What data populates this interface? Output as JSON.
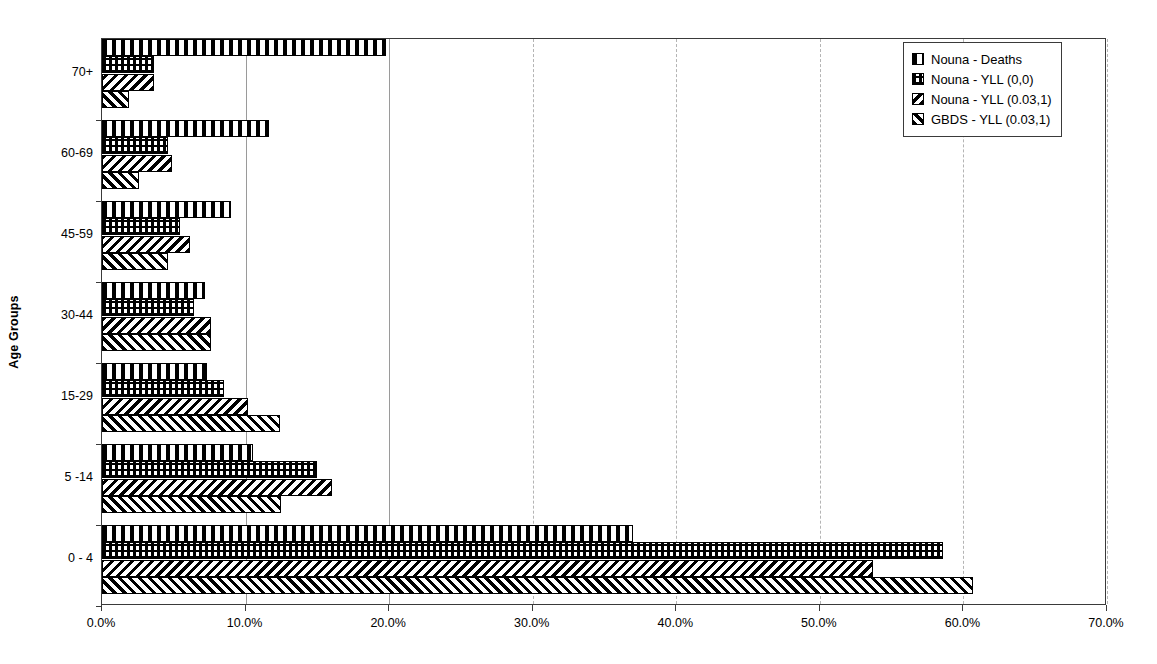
{
  "chart_data": {
    "type": "bar",
    "orientation": "horizontal",
    "title": "",
    "xlabel": "",
    "ylabel": "Age Groups",
    "categories": [
      "0 - 4",
      "5 -14",
      "15-29",
      "30-44",
      "45-59",
      "60-69",
      "70+"
    ],
    "category_order_top_to_bottom": [
      "70+",
      "60-69",
      "45-59",
      "30-44",
      "15-29",
      "5 -14",
      "0 - 4"
    ],
    "xlim": [
      0,
      70
    ],
    "xticks": [
      0,
      10,
      20,
      30,
      40,
      50,
      60,
      70
    ],
    "xticklabels": [
      "0.0%",
      "10.0%",
      "20.0%",
      "30.0%",
      "40.0%",
      "50.0%",
      "60.0%",
      "70.0%"
    ],
    "grid": "vertical",
    "legend_position": "top-right",
    "series": [
      {
        "name": "Nouna - Deaths",
        "pattern": "vertical-stripes",
        "values": [
          37.0,
          10.5,
          7.3,
          7.2,
          9.0,
          11.6,
          19.8
        ]
      },
      {
        "name": "Nouna - YLL (0,0)",
        "pattern": "cross-hatch-grid",
        "values": [
          58.6,
          15.0,
          8.5,
          6.4,
          5.4,
          4.6,
          3.6
        ]
      },
      {
        "name": "Nouna - YLL (0.03,1)",
        "pattern": "backward-diagonal",
        "values": [
          53.7,
          16.0,
          10.2,
          7.6,
          6.1,
          4.9,
          3.6
        ]
      },
      {
        "name": "GBDS - YLL (0.03,1)",
        "pattern": "forward-diagonal",
        "values": [
          60.7,
          12.5,
          12.4,
          7.6,
          4.6,
          2.6,
          1.9
        ]
      }
    ]
  },
  "legend": {
    "items": [
      {
        "label": "Nouna - Deaths"
      },
      {
        "label": "Nouna - YLL (0,0)"
      },
      {
        "label": "Nouna - YLL (0.03,1)"
      },
      {
        "label": "GBDS - YLL (0.03,1)"
      }
    ]
  },
  "axes": {
    "y_title": "Age Groups"
  }
}
